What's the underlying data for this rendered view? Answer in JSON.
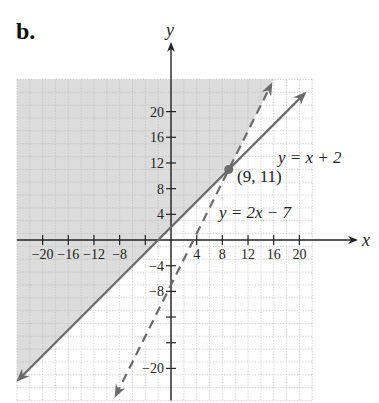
{
  "panel_label": "b.",
  "chart_data": {
    "type": "line",
    "title": "",
    "xlabel": "x",
    "ylabel": "y",
    "xlim": [
      -24,
      22
    ],
    "ylim": [
      -25,
      25
    ],
    "grid": true,
    "grid_step": 2,
    "x_ticks": [
      -20,
      -16,
      -12,
      -8,
      -4,
      4,
      8,
      12,
      16,
      20
    ],
    "x_tick_labels": [
      "−20",
      "−16",
      "−12",
      "−8",
      "",
      "4",
      "8",
      "12",
      "16",
      "20"
    ],
    "y_ticks": [
      20,
      16,
      12,
      8,
      4,
      -4,
      -8,
      -12,
      -16,
      -20
    ],
    "y_tick_labels": [
      "20",
      "16",
      "12",
      "8",
      "4",
      "−4",
      "−8",
      "",
      "",
      "−20"
    ],
    "series": [
      {
        "name": "y = x + 2",
        "slope": 1,
        "intercept": 2,
        "style": "solid",
        "color": "#6b6b6b"
      },
      {
        "name": "y = 2x − 7",
        "slope": 2,
        "intercept": -7,
        "style": "dashed",
        "color": "#6b6b6b"
      }
    ],
    "annotations": [
      {
        "text": "(9, 11)",
        "x": 9,
        "y": 11,
        "marker": "point"
      },
      {
        "text": "y = x + 2",
        "x": 14.5,
        "y": 13
      },
      {
        "text": "y = 2x − 7",
        "x": 8,
        "y": 4
      }
    ],
    "shaded_region": {
      "description": "y ≥ x + 2 and y > 2x − 7",
      "color": "#d9d9d9"
    },
    "colors": {
      "shade": "#dcdcdc",
      "grid": "#b8b8b8",
      "axis": "#222222",
      "line": "#6b6b6b"
    }
  }
}
